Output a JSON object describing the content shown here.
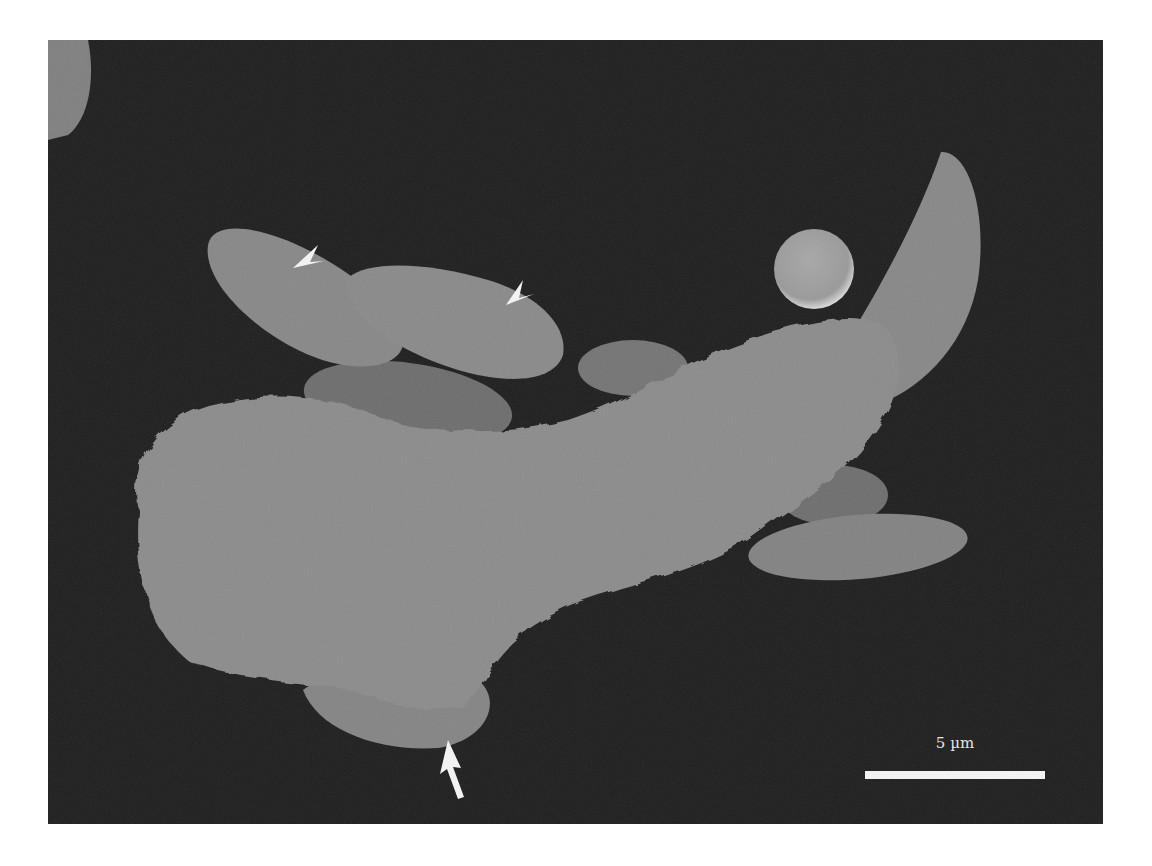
{
  "figure": {
    "type": "scanning electron micrograph",
    "background_color": "#1f1f1f",
    "scale_bar": {
      "label": "5 µm",
      "color": "#f2f2f2"
    },
    "annotations": [
      {
        "kind": "arrowhead",
        "target": "crescent cell (left)"
      },
      {
        "kind": "arrowhead",
        "target": "crescent cell (middle)"
      },
      {
        "kind": "arrow",
        "target": "crescent cell beneath large cell"
      }
    ]
  }
}
